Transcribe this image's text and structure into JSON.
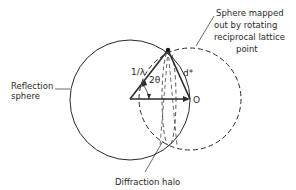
{
  "diagram": {
    "labels": {
      "reflection_sphere_line1": "Reflection",
      "reflection_sphere_line2": "sphere",
      "mapped_sphere_line1": "Sphere  mapped",
      "mapped_sphere_line2": "out  by rotating",
      "mapped_sphere_line3": "reciprocal  lattice",
      "mapped_sphere_line4": "point",
      "diffraction_halo": "Diffraction  halo",
      "wavevector": "1/λ",
      "angle": "2θ",
      "reciprocal_vector": "d*",
      "origin": "O"
    },
    "colors": {
      "line": "#2a2a2a",
      "background": "#ffffff"
    }
  }
}
